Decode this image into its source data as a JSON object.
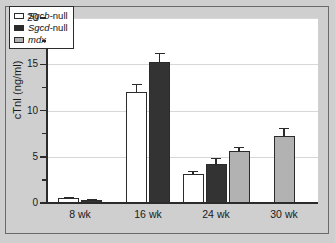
{
  "chart_data": {
    "type": "bar",
    "title": "",
    "xlabel": "",
    "ylabel": "cTnI (ng/ml)",
    "categories": [
      "8 wk",
      "16 wk",
      "24 wk",
      "30 wk"
    ],
    "ylim": [
      0,
      20
    ],
    "yticks": [
      0,
      5,
      10,
      15,
      20
    ],
    "ytick_labels": [
      "0",
      "5",
      "10",
      "15",
      "20"
    ],
    "yminor_ticks": [
      2.5,
      7.5,
      12.5,
      17.5
    ],
    "grid": true,
    "legend_position": "upper-left",
    "error_bars": "upper-only",
    "series": [
      {
        "name": "Sgcb-null",
        "gene": "Sgcb",
        "suffix": "-null",
        "color": "#ffffff",
        "values": [
          0.5,
          12.0,
          3.1,
          null
        ],
        "errors": [
          0.1,
          0.9,
          0.4,
          null
        ]
      },
      {
        "name": "Sgcd-null",
        "gene": "Sgcd",
        "suffix": "-null",
        "color": "#333333",
        "values": [
          0.3,
          15.2,
          4.2,
          null
        ],
        "errors": [
          0.1,
          1.0,
          0.7,
          null
        ]
      },
      {
        "name": "mdx",
        "gene": "mdx",
        "suffix": "",
        "color": "#b2b2b2",
        "values": [
          null,
          null,
          5.6,
          7.2
        ],
        "errors": [
          null,
          null,
          0.5,
          0.9
        ]
      }
    ]
  }
}
